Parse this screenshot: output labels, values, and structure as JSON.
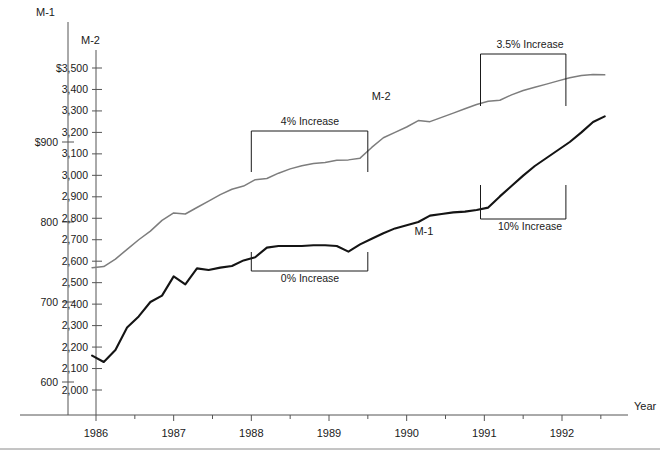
{
  "page": {
    "clipped_title_fragment": "",
    "background": "#ffffff"
  },
  "axes": {
    "m1": {
      "name": "M-1",
      "header_label": "M-1",
      "tick_labels": [
        "$900",
        "800",
        "700",
        "600"
      ],
      "tick_values": [
        900,
        800,
        700,
        600
      ],
      "range": [
        560,
        960
      ]
    },
    "m2": {
      "name": "M-2",
      "header_label": "M-2",
      "tick_labels": [
        "$3,500",
        "3,400",
        "3,300",
        "3,200",
        "3,100",
        "3,000",
        "2,900",
        "2,800",
        "2,700",
        "2,600",
        "2,500",
        "2,400",
        "2,300",
        "2,200",
        "2,100",
        "2,000"
      ],
      "tick_values": [
        3500,
        3400,
        3300,
        3200,
        3100,
        3000,
        2900,
        2800,
        2700,
        2600,
        2500,
        2400,
        2300,
        2200,
        2100,
        2000
      ],
      "range": [
        1960,
        3540
      ]
    },
    "x": {
      "label": "Year",
      "tick_labels": [
        "1986",
        "1987",
        "1988",
        "1989",
        "1990",
        "1991",
        "1992"
      ],
      "tick_values": [
        1986,
        1987,
        1988,
        1989,
        1990,
        1991,
        1992
      ],
      "range": [
        1985.85,
        1992.75
      ]
    }
  },
  "colors": {
    "m1_line": "#141414",
    "m2_line": "#7d7d7d",
    "axis": "#555555",
    "text": "#1a1a1a"
  },
  "series_labels": [
    {
      "text": "M-2",
      "x": 1989.55,
      "y_px": 100
    },
    {
      "text": "M-1",
      "x": 1990.1,
      "y_px": 235
    }
  ],
  "annotations": [
    {
      "text": "4% Increase",
      "start_year": 1988.0,
      "end_year": 1989.5,
      "position": "above",
      "label_x_px": 310,
      "label_y_px": 125,
      "bracket_top_px": 131,
      "bracket_bottom_px": 172
    },
    {
      "text": "0% Increase",
      "start_year": 1988.0,
      "end_year": 1989.5,
      "position": "below",
      "label_x_px": 310,
      "label_y_px": 282,
      "bracket_top_px": 252,
      "bracket_bottom_px": 271
    },
    {
      "text": "3.5% Increase",
      "start_year": 1990.95,
      "end_year": 1992.05,
      "position": "above",
      "label_x_px": 530,
      "label_y_px": 48,
      "bracket_top_px": 54,
      "bracket_bottom_px": 106
    },
    {
      "text": "10% Increase",
      "start_year": 1990.95,
      "end_year": 1992.05,
      "position": "below",
      "label_x_px": 530,
      "label_y_px": 230,
      "bracket_top_px": 185,
      "bracket_bottom_px": 219
    }
  ],
  "chart_data": {
    "type": "line",
    "title": "",
    "xlabel": "Year",
    "ylabel": "M-1 / M-2 ($ billions)",
    "xlim": [
      1985.85,
      1992.75
    ],
    "grid": false,
    "legend": "inline-labels",
    "x": [
      1985.95,
      1986.1,
      1986.25,
      1986.4,
      1986.55,
      1986.7,
      1986.85,
      1987.0,
      1987.15,
      1987.3,
      1987.45,
      1987.6,
      1987.75,
      1987.9,
      1988.05,
      1988.2,
      1988.35,
      1988.5,
      1988.65,
      1988.8,
      1988.95,
      1989.1,
      1989.25,
      1989.4,
      1989.55,
      1989.7,
      1989.85,
      1990.0,
      1990.15,
      1990.3,
      1990.45,
      1990.6,
      1990.75,
      1990.9,
      1991.05,
      1991.2,
      1991.35,
      1991.5,
      1991.65,
      1991.8,
      1991.95,
      1992.1,
      1992.25,
      1992.4,
      1992.55
    ],
    "series": [
      {
        "name": "M-1",
        "axis": "m1",
        "color": "#141414",
        "ylim": [
          560,
          960
        ],
        "yticks": [
          600,
          700,
          800,
          900
        ],
        "values": [
          633,
          625,
          640,
          668,
          682,
          700,
          708,
          732,
          722,
          742,
          740,
          743,
          745,
          752,
          756,
          768,
          770,
          770,
          770,
          771,
          771,
          770,
          763,
          772,
          779,
          786,
          792,
          796,
          800,
          808,
          810,
          812,
          813,
          815,
          818,
          832,
          845,
          858,
          870,
          880,
          890,
          900,
          912,
          925,
          932
        ]
      },
      {
        "name": "M-2",
        "axis": "m2",
        "color": "#7d7d7d",
        "ylim": [
          1960,
          3540
        ],
        "yticks": [
          2000,
          2100,
          2200,
          2300,
          2400,
          2500,
          2600,
          2700,
          2800,
          2900,
          3000,
          3100,
          3200,
          3300,
          3400,
          3500
        ],
        "values": [
          2570,
          2575,
          2610,
          2655,
          2700,
          2740,
          2790,
          2825,
          2820,
          2850,
          2880,
          2910,
          2935,
          2950,
          2980,
          2985,
          3010,
          3030,
          3045,
          3055,
          3060,
          3070,
          3072,
          3080,
          3130,
          3175,
          3200,
          3225,
          3255,
          3250,
          3270,
          3290,
          3310,
          3330,
          3345,
          3350,
          3375,
          3395,
          3410,
          3425,
          3440,
          3455,
          3465,
          3470,
          3468
        ]
      }
    ]
  }
}
